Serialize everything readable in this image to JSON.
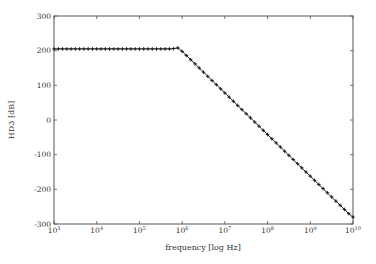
{
  "chart_data": {
    "type": "line",
    "title": "",
    "xlabel": "frequency [log Hz]",
    "ylabel": "HD3 [dB]",
    "xscale": "log",
    "xlim": [
      1000,
      10000000000
    ],
    "ylim": [
      -300,
      300
    ],
    "x_ticks": [
      {
        "value": 3,
        "base": "10",
        "exp": "3"
      },
      {
        "value": 4,
        "base": "10",
        "exp": "4"
      },
      {
        "value": 5,
        "base": "10",
        "exp": "5"
      },
      {
        "value": 6,
        "base": "10",
        "exp": "6"
      },
      {
        "value": 7,
        "base": "10",
        "exp": "7"
      },
      {
        "value": 8,
        "base": "10",
        "exp": "8"
      },
      {
        "value": 9,
        "base": "10",
        "exp": "9"
      },
      {
        "value": 10,
        "base": "10",
        "exp": "10"
      }
    ],
    "y_ticks": [
      300,
      200,
      100,
      0,
      -100,
      -200,
      -300
    ],
    "grid": false,
    "legend": null,
    "marker": "+",
    "series": [
      {
        "name": "HD3",
        "log10_x": [
          3.0,
          3.1,
          3.2,
          3.3,
          3.4,
          3.5,
          3.6,
          3.7,
          3.8,
          3.9,
          4.0,
          4.1,
          4.2,
          4.3,
          4.4,
          4.5,
          4.6,
          4.7,
          4.8,
          4.9,
          5.0,
          5.1,
          5.2,
          5.3,
          5.4,
          5.5,
          5.6,
          5.7,
          5.8,
          5.9,
          6.0,
          6.1,
          6.2,
          6.3,
          6.4,
          6.5,
          6.6,
          6.7,
          6.8,
          6.9,
          7.0,
          7.1,
          7.2,
          7.3,
          7.4,
          7.5,
          7.6,
          7.7,
          7.8,
          7.9,
          8.0,
          8.1,
          8.2,
          8.3,
          8.4,
          8.5,
          8.6,
          8.7,
          8.8,
          8.9,
          9.0,
          9.1,
          9.2,
          9.3,
          9.4,
          9.5,
          9.6,
          9.7,
          9.8,
          9.9,
          10.0
        ],
        "y": [
          205,
          205,
          205,
          205,
          205,
          205,
          205,
          205,
          205,
          205,
          205,
          205,
          205,
          205,
          205,
          205,
          205,
          205,
          205,
          205,
          205,
          205,
          205,
          205,
          205,
          205,
          205,
          205,
          206,
          208,
          198,
          186,
          174,
          162,
          150,
          138,
          126,
          114,
          102,
          90,
          78,
          66,
          54,
          42,
          30,
          18,
          6,
          -6,
          -18,
          -30,
          -42,
          -54,
          -66,
          -78,
          -90,
          -102,
          -114,
          -126,
          -138,
          -150,
          -162,
          -174,
          -186,
          -198,
          -210,
          -222,
          -234,
          -246,
          -258,
          -270,
          -280
        ]
      }
    ]
  }
}
